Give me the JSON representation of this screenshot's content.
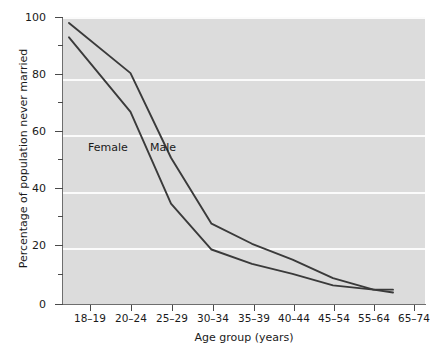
{
  "chart_data": {
    "type": "line",
    "title": "",
    "xlabel": "Age group (years)",
    "ylabel": "Percentage of population never married",
    "categories": [
      "18–19",
      "20–24",
      "25–29",
      "30–34",
      "35–39",
      "40–44",
      "45–54",
      "55–64",
      "65–74"
    ],
    "ylim": [
      0,
      100
    ],
    "xlim_note": "categorical, ticks centered on labels",
    "y_major_ticks": [
      0,
      20,
      40,
      60,
      80,
      100
    ],
    "y_minor_ticks": [
      10,
      30,
      50,
      70,
      90
    ],
    "y_tick_labels": [
      "0",
      "20",
      "40",
      "60",
      "80",
      "100"
    ],
    "grid": "horizontal gridlines at major y values, white on grey panel",
    "legend_position": "inline series labels on plot",
    "series": [
      {
        "name": "Male",
        "color": "#3a3a3a",
        "values": [
          98,
          80.5,
          51,
          28,
          21,
          15.5,
          9,
          5,
          5
        ],
        "starts_before_first_tick": true,
        "ends_after_last_but_one_tick": true
      },
      {
        "name": "Female",
        "color": "#3a3a3a",
        "values": [
          93,
          67,
          35,
          19,
          14,
          10.5,
          6.5,
          5,
          4
        ],
        "starts_before_first_tick": true,
        "ends_after_last_but_one_tick": true
      }
    ],
    "annotations": [
      {
        "text": "Female",
        "x_px": 88,
        "y_px": 141
      },
      {
        "text": "Male",
        "x_px": 150,
        "y_px": 141
      }
    ],
    "colors": {
      "panel_background": "#dcdcdc",
      "gridline": "#fbfbfb",
      "axis": "#6e6e6e",
      "line": "#3a3a3a",
      "text": "#1a1a1a",
      "page_background": "#ffffff"
    }
  },
  "axis_titles": {
    "y": "Percentage of population never married",
    "x": "Age group (years)"
  }
}
